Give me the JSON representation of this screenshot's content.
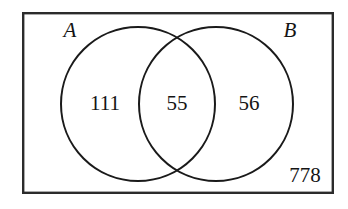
{
  "figure": {
    "type": "venn-diagram",
    "title": "",
    "sets": 2,
    "background_color": "#ffffff",
    "line_color": "#1a1a1a",
    "border_color": "#2b2b2b",
    "text_color": "#141414"
  },
  "universe": {
    "label": "",
    "outside_count": "778"
  },
  "set_labels": {
    "a": "A",
    "b": "B"
  },
  "regions": [
    {
      "key": "a_only",
      "label": "111",
      "set": "A",
      "x": 105,
      "y": 104
    },
    {
      "key": "intersection",
      "label": "55",
      "set": "A and B",
      "x": 177,
      "y": 104
    },
    {
      "key": "b_only",
      "label": "56",
      "set": "B",
      "x": 249,
      "y": 104
    },
    {
      "key": "outside",
      "label": "778",
      "set": "neither",
      "x": 305,
      "y": 176
    }
  ],
  "counts": {
    "a_only": "111",
    "intersection": "55",
    "b_only": "56",
    "outside": "778"
  },
  "geometry": {
    "rect": {
      "x": 22,
      "y": 12,
      "width": 312,
      "height": 182
    },
    "circle_a": {
      "cx": 138,
      "cy": 104,
      "r": 77
    },
    "circle_b": {
      "cx": 216,
      "cy": 104,
      "r": 77
    },
    "label_a": {
      "x": 70,
      "y": 31
    },
    "label_b": {
      "x": 290,
      "y": 31
    }
  }
}
